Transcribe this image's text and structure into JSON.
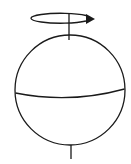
{
  "diagram": {
    "colors": {
      "stroke": "#1a1a1a",
      "background": "#ffffff"
    },
    "elements": [
      "rotation-arrow",
      "rotation-axis",
      "sphere-outline",
      "equator"
    ]
  }
}
